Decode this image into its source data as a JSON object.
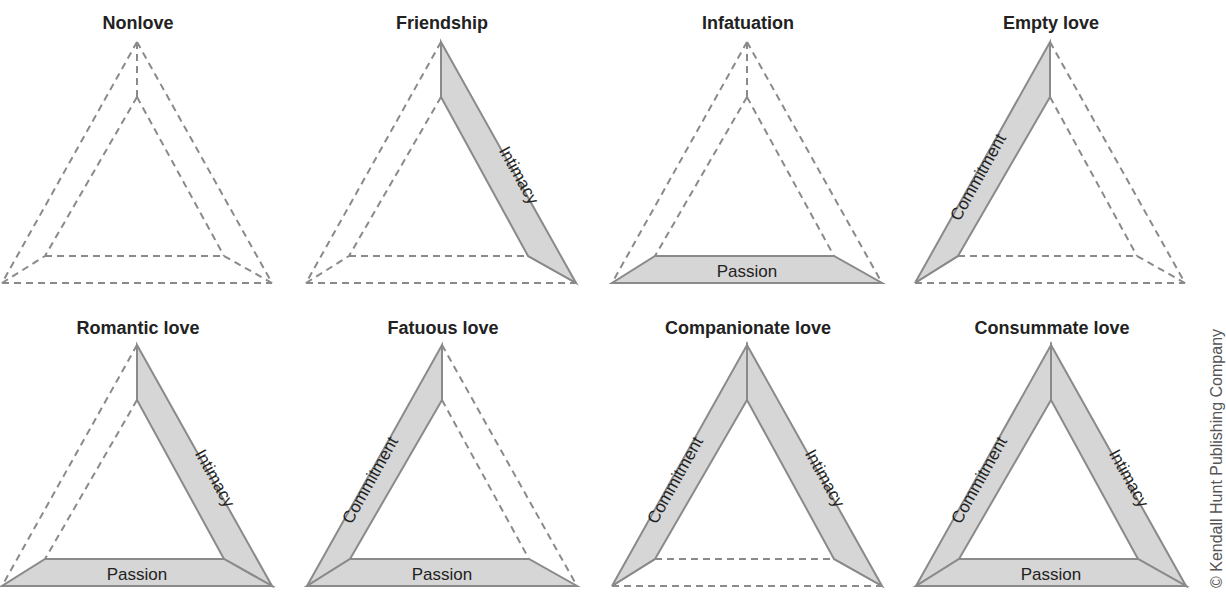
{
  "figure": {
    "components": [
      "Intimacy",
      "Passion",
      "Commitment"
    ],
    "colors": {
      "band_fill": "#d6d6d6",
      "band_stroke": "#8a8a8a",
      "dashed": "#8a8a8a",
      "text": "#222222"
    },
    "panels": [
      {
        "title": "Nonlove",
        "intimacy": false,
        "passion": false,
        "commitment": false
      },
      {
        "title": "Friendship",
        "intimacy": true,
        "passion": false,
        "commitment": false
      },
      {
        "title": "Infatuation",
        "intimacy": false,
        "passion": true,
        "commitment": false
      },
      {
        "title": "Empty love",
        "intimacy": false,
        "passion": false,
        "commitment": true
      },
      {
        "title": "Romantic love",
        "intimacy": true,
        "passion": true,
        "commitment": false
      },
      {
        "title": "Fatuous love",
        "intimacy": false,
        "passion": true,
        "commitment": true
      },
      {
        "title": "Companionate love",
        "intimacy": true,
        "passion": false,
        "commitment": true
      },
      {
        "title": "Consummate love",
        "intimacy": true,
        "passion": true,
        "commitment": true
      }
    ],
    "labels": {
      "intimacy": "Intimacy",
      "passion": "Passion",
      "commitment": "Commitment"
    },
    "copyright": "© Kendall Hunt Publishing Company"
  }
}
